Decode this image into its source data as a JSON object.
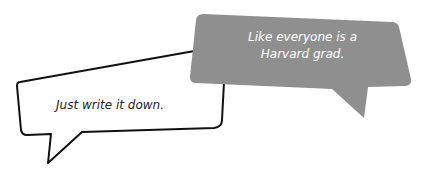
{
  "bubbles": {
    "left": {
      "text": "Just write it down.",
      "fill": "#ffffff",
      "stroke": "#111111"
    },
    "right": {
      "line1": "Like everyone is a",
      "line2": "Harvard grad.",
      "fill": "#8f8f8f",
      "text_color": "#ffffff"
    }
  }
}
